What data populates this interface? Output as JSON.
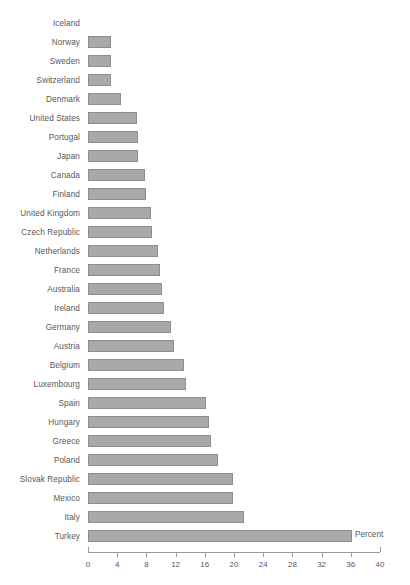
{
  "chart_data": {
    "type": "bar",
    "orientation": "horizontal",
    "title": "",
    "xlabel": "Percent",
    "ylabel": "",
    "xlim": [
      0,
      40
    ],
    "xticks": [
      0,
      4,
      8,
      12,
      16,
      20,
      24,
      28,
      32,
      36,
      40
    ],
    "grid": false,
    "legend": null,
    "bar_color": "#a9a9a9",
    "bar_border_color": "#8e8e8e",
    "categories": [
      "Iceland",
      "Norway",
      "Sweden",
      "Switzerland",
      "Denmark",
      "United States",
      "Portugal",
      "Japan",
      "Canada",
      "Finland",
      "United Kingdom",
      "Czech Republic",
      "Netherlands",
      "France",
      "Australia",
      "Ireland",
      "Germany",
      "Austria",
      "Belgium",
      "Luxembourg",
      "Spain",
      "Hungary",
      "Greece",
      "Poland",
      "Slovak Republic",
      "Mexico",
      "Italy",
      "Turkey"
    ],
    "values": [
      0,
      3.1,
      3.1,
      3.2,
      4.5,
      6.7,
      6.8,
      6.8,
      7.8,
      7.9,
      8.6,
      8.8,
      9.6,
      9.8,
      10.2,
      10.4,
      11.4,
      11.8,
      13.2,
      13.4,
      16.2,
      16.6,
      16.8,
      17.8,
      19.8,
      19.9,
      21.4,
      36.2
    ]
  },
  "axis": {
    "x_title": "Percent",
    "tick_labels": [
      "0",
      "4",
      "8",
      "12",
      "16",
      "20",
      "24",
      "28",
      "32",
      "36",
      "40"
    ]
  }
}
